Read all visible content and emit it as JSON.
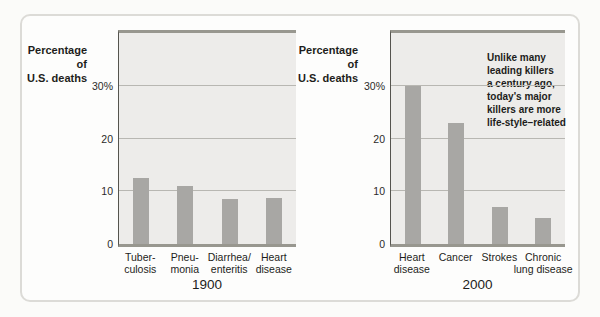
{
  "labels": {
    "ylabel": "Percentage\nof\nU.S. deaths",
    "annotation": "Unlike many\nleading killers\na century ago,\ntoday's major\nkillers are more\nlife-style–related"
  },
  "colors": {
    "bar": "#a8a7a4",
    "plot_background": "#edecea",
    "gridline": "#b8b7b2",
    "frame_line": "#98978f",
    "axis_line": "#55544e",
    "card_border": "#dcdbd7",
    "text": "#1d1d1b"
  },
  "chart_data": [
    {
      "type": "bar",
      "title": "1900",
      "xlabel": "1900",
      "ylabel": "Percentage of U.S. deaths",
      "categories": [
        "Tuberculosis",
        "Pneumonia",
        "Diarrhea/enteritis",
        "Heart disease"
      ],
      "category_display": [
        "Tuber-\nculosis",
        "Pneu-\nmonia",
        "Diarrhea/\nenteritis",
        "Heart\ndisease"
      ],
      "values": [
        12.5,
        11,
        8.5,
        8.8
      ],
      "ylim": [
        0,
        40
      ],
      "yticks": [
        {
          "value": 30,
          "label": "30%"
        },
        {
          "value": 20,
          "label": "20"
        },
        {
          "value": 10,
          "label": "10"
        },
        {
          "value": 0,
          "label": "0"
        }
      ],
      "grid": true,
      "legend": false
    },
    {
      "type": "bar",
      "title": "2000",
      "xlabel": "2000",
      "ylabel": "Percentage of U.S. deaths",
      "categories": [
        "Heart disease",
        "Cancer",
        "Strokes",
        "Chronic lung disease"
      ],
      "category_display": [
        "Heart\ndisease",
        "Cancer",
        "Strokes",
        "Chronic\nlung disease"
      ],
      "values": [
        30,
        23,
        7,
        5
      ],
      "ylim": [
        0,
        40
      ],
      "yticks": [
        {
          "value": 30,
          "label": "30%"
        },
        {
          "value": 20,
          "label": "20"
        },
        {
          "value": 10,
          "label": "10"
        },
        {
          "value": 0,
          "label": "0"
        }
      ],
      "grid": true,
      "legend": false,
      "annotation": "Unlike many leading killers a century ago, today's major killers are more life-style–related"
    }
  ]
}
